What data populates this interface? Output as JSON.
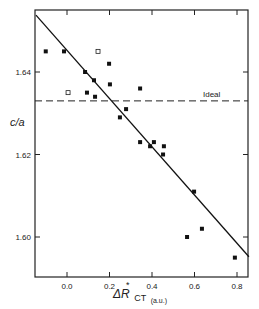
{
  "chart_data": {
    "type": "scatter",
    "title": "",
    "xlabel": "ΔR*CT (a.u.)",
    "xlabel_main": "ΔR",
    "xlabel_sub": "CT",
    "xlabel_sup": "*",
    "xlabel_unit": "(a.u.)",
    "ylabel": "c/a",
    "xlim": [
      -0.15,
      0.85
    ],
    "ylim": [
      1.589,
      1.6545
    ],
    "xticks": [
      0.0,
      0.2,
      0.4,
      0.6,
      0.8
    ],
    "xtick_labels": [
      "0.0",
      "0.2",
      "0.4",
      "0.6",
      "0.8"
    ],
    "yticks": [
      1.6,
      1.62,
      1.64
    ],
    "ytick_labels": [
      "1.60",
      "1.62",
      "1.64"
    ],
    "grid": false,
    "legend": null,
    "annotations": [
      {
        "type": "hline",
        "y": 1.633,
        "style": "dashed",
        "label": "Ideal"
      },
      {
        "type": "fit_line",
        "x": [
          -0.146,
          0.856
        ],
        "y": [
          1.6538,
          1.5952
        ]
      }
    ],
    "series": [
      {
        "name": "filled squares",
        "marker": "filled-square",
        "points": [
          [
            -0.1,
            1.645
          ],
          [
            -0.014,
            1.645
          ],
          [
            0.198,
            1.642
          ],
          [
            0.085,
            1.64
          ],
          [
            0.127,
            1.638
          ],
          [
            0.202,
            1.637
          ],
          [
            0.094,
            1.635
          ],
          [
            0.132,
            1.634
          ],
          [
            0.344,
            1.636
          ],
          [
            0.278,
            1.631
          ],
          [
            0.249,
            1.629
          ],
          [
            0.344,
            1.623
          ],
          [
            0.409,
            1.623
          ],
          [
            0.391,
            1.622
          ],
          [
            0.456,
            1.622
          ],
          [
            0.452,
            1.62
          ],
          [
            0.598,
            1.611
          ],
          [
            0.635,
            1.602
          ],
          [
            0.565,
            1.6
          ],
          [
            0.79,
            1.595
          ]
        ]
      },
      {
        "name": "open squares",
        "marker": "open-square",
        "points": [
          [
            0.146,
            1.645
          ],
          [
            0.005,
            1.635
          ]
        ]
      }
    ]
  }
}
